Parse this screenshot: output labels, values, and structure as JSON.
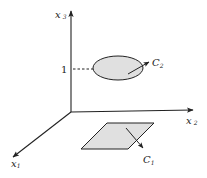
{
  "diagram": {
    "axes": {
      "x1": {
        "name": "x",
        "sub": "1"
      },
      "x2": {
        "name": "x",
        "sub": "2"
      },
      "x3": {
        "name": "x",
        "sub": "3"
      }
    },
    "tick": {
      "x3_value": "1"
    },
    "shapes": {
      "ellipse": {
        "label_name": "C",
        "label_sub": "2",
        "height_on_x3": "1"
      },
      "parallelogram": {
        "label_name": "C",
        "label_sub": "1"
      }
    },
    "colors": {
      "fill": "#e0e0e0",
      "stroke": "#222222"
    }
  }
}
